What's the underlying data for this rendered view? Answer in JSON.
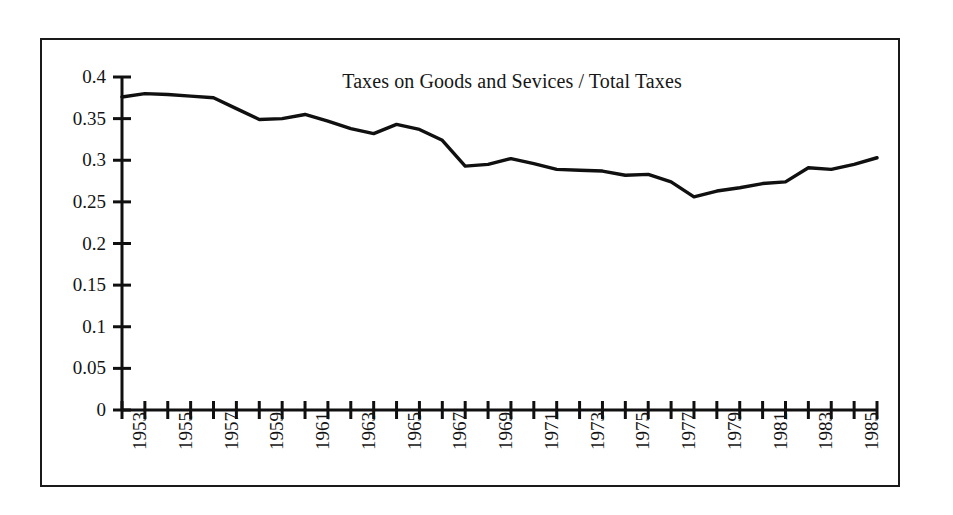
{
  "figure": {
    "background_color": "#ffffff",
    "frame_color": "#1a1a1a",
    "line_color": "#101010"
  },
  "chart_data": {
    "type": "line",
    "title": "Taxes on Goods and Sevices / Total Taxes",
    "xlabel": "",
    "ylabel": "",
    "xlim": [
      1953,
      1986
    ],
    "ylim": [
      0,
      0.4
    ],
    "grid": false,
    "legend": null,
    "ytick_labels": [
      "0.4",
      "0.35",
      "0.3",
      "0.25",
      "0.2",
      "0.15",
      "0.1",
      "0.05",
      "0"
    ],
    "ytick_values": [
      0.4,
      0.35,
      0.3,
      0.25,
      0.2,
      0.15,
      0.1,
      0.05,
      0
    ],
    "xtick_labels": [
      "1953",
      "1955",
      "1957",
      "1959",
      "1961",
      "1963",
      "1965",
      "1967",
      "1969",
      "1971",
      "1973",
      "1975",
      "1977",
      "1979",
      "1981",
      "1983",
      "1985"
    ],
    "xtick_values": [
      1953,
      1955,
      1957,
      1959,
      1961,
      1963,
      1965,
      1967,
      1969,
      1971,
      1973,
      1975,
      1977,
      1979,
      1981,
      1983,
      1985
    ],
    "x": [
      1953,
      1954,
      1955,
      1956,
      1957,
      1958,
      1959,
      1960,
      1961,
      1962,
      1963,
      1964,
      1965,
      1966,
      1967,
      1968,
      1969,
      1970,
      1971,
      1972,
      1973,
      1974,
      1975,
      1976,
      1977,
      1978,
      1979,
      1980,
      1981,
      1982,
      1983,
      1984,
      1985,
      1986
    ],
    "series": [
      {
        "name": "Taxes on Goods and Sevices / Total Taxes",
        "values": [
          0.376,
          0.38,
          0.379,
          0.377,
          0.375,
          0.362,
          0.349,
          0.35,
          0.355,
          0.347,
          0.338,
          0.332,
          0.343,
          0.337,
          0.324,
          0.293,
          0.295,
          0.302,
          0.296,
          0.289,
          0.288,
          0.287,
          0.282,
          0.283,
          0.274,
          0.256,
          0.263,
          0.267,
          0.272,
          0.274,
          0.291,
          0.289,
          0.295,
          0.303
        ]
      }
    ]
  },
  "annotations": {
    "title_typo": "Sevices"
  }
}
